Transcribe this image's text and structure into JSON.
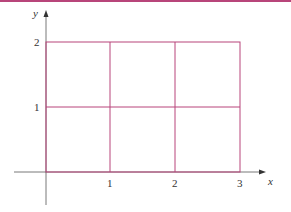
{
  "diagram": {
    "type": "grid-rectangle",
    "axes": {
      "x_label": "x",
      "y_label": "y",
      "x_ticks": [
        "1",
        "2",
        "3"
      ],
      "y_ticks": [
        "1",
        "2"
      ]
    },
    "grid": {
      "x_range": [
        0,
        3
      ],
      "y_range": [
        0,
        2
      ],
      "cells": "3x2 unit squares"
    },
    "colors": {
      "grid_line": "#b8457a",
      "axis": "#444444",
      "top_border": "#b8457a"
    }
  }
}
